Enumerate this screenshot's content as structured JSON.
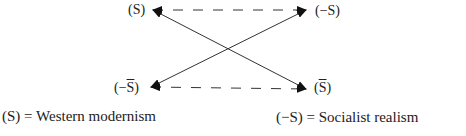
{
  "diagram": {
    "type": "semiotic-square",
    "nodes": {
      "top_left": {
        "sym": "S",
        "neg": false,
        "bar": false,
        "text": "(S)"
      },
      "top_right": {
        "sym": "S",
        "neg": true,
        "bar": false,
        "text": "(−S)"
      },
      "bottom_left": {
        "sym": "S",
        "neg": true,
        "bar": true,
        "prefix": "(−",
        "suffix": ")"
      },
      "bottom_right": {
        "sym": "S",
        "neg": false,
        "bar": true,
        "prefix": "(",
        "suffix": ")"
      }
    },
    "edges": [
      {
        "from": "top_left",
        "to": "top_right",
        "style": "dashed",
        "arrows": "both"
      },
      {
        "from": "bottom_left",
        "to": "bottom_right",
        "style": "dashed",
        "arrows": "both"
      },
      {
        "from": "top_left",
        "to": "bottom_right",
        "style": "solid",
        "arrows": "both"
      },
      {
        "from": "top_right",
        "to": "bottom_left",
        "style": "solid",
        "arrows": "both"
      }
    ]
  },
  "legend": {
    "left": "(S)  =  Western modernism",
    "right": "(−S)  =  Socialist realism"
  }
}
